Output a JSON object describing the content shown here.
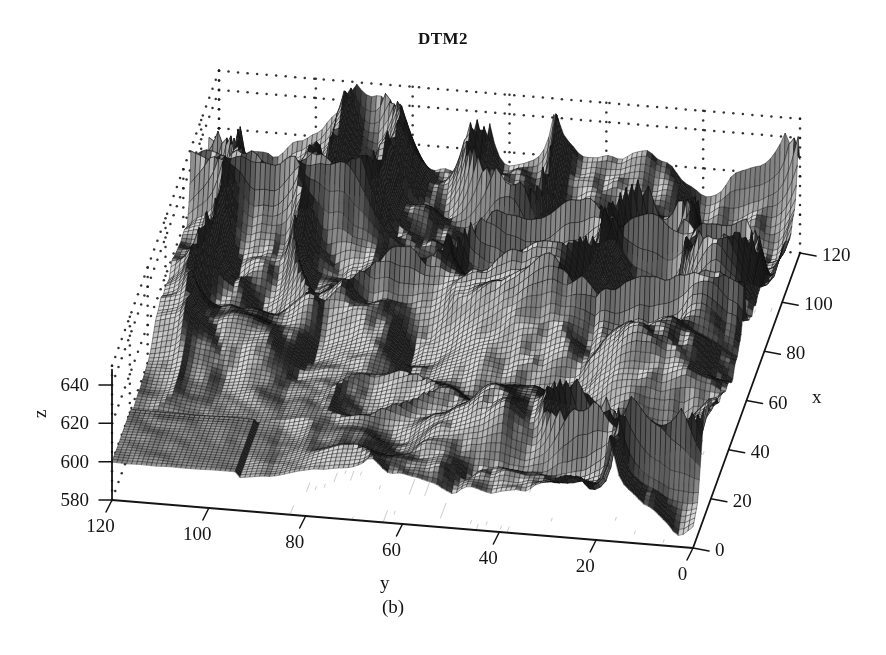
{
  "figure": {
    "title": "DTM2",
    "caption": "(b)",
    "background_color": "#ffffff",
    "ink_color": "#141414"
  },
  "chart_data": {
    "type": "surface",
    "title": "DTM2",
    "subtitle": "(b)",
    "xlabel": "x",
    "ylabel": "y",
    "zlabel": "z",
    "projection": "3d-mesh-surface",
    "grid": "dotted",
    "legend": "none",
    "colormap": "grayscale",
    "xlim": [
      0,
      120
    ],
    "ylim": [
      0,
      120
    ],
    "zlim": [
      575,
      650
    ],
    "xticks": [
      0,
      20,
      40,
      60,
      80,
      100,
      120
    ],
    "yticks": [
      0,
      20,
      40,
      60,
      80,
      100,
      120
    ],
    "zticks": [
      580,
      600,
      620,
      640
    ],
    "xtick_labels": [
      "0",
      "20",
      "40",
      "60",
      "80",
      "100",
      "120"
    ],
    "ytick_labels": [
      "120",
      "100",
      "80",
      "60",
      "40",
      "20",
      "0"
    ],
    "ztick_labels": [
      "640",
      "620",
      "600",
      "580"
    ],
    "x_axis_direction": "increasing-up-right",
    "y_axis_direction": "decreasing-left-to-right",
    "surface_description": "Digital terrain model mesh surface with flat plateau in the foreground-left near z=600 rising to rugged peaks up to z=645 toward the back and right",
    "z_min_observed": 578,
    "z_max_observed": 648,
    "z_plateau": 600,
    "mesh_resolution": [
      120,
      120
    ],
    "contours_on_floor": true
  },
  "axes": {
    "z": {
      "label": "z",
      "ticks": [
        {
          "value": 640,
          "text": "640"
        },
        {
          "value": 620,
          "text": "620"
        },
        {
          "value": 600,
          "text": "600"
        },
        {
          "value": 580,
          "text": "580"
        }
      ]
    },
    "y": {
      "label": "y",
      "ticks": [
        {
          "value": 120,
          "text": "120"
        },
        {
          "value": 100,
          "text": "100"
        },
        {
          "value": 80,
          "text": "80"
        },
        {
          "value": 60,
          "text": "60"
        },
        {
          "value": 40,
          "text": "40"
        },
        {
          "value": 20,
          "text": "20"
        },
        {
          "value": 0,
          "text": "0"
        }
      ]
    },
    "x": {
      "label": "x",
      "ticks": [
        {
          "value": 120,
          "text": "120"
        },
        {
          "value": 100,
          "text": "100"
        },
        {
          "value": 80,
          "text": "80"
        },
        {
          "value": 60,
          "text": "60"
        },
        {
          "value": 40,
          "text": "40"
        },
        {
          "value": 20,
          "text": "20"
        },
        {
          "value": 0,
          "text": "0"
        }
      ]
    }
  }
}
